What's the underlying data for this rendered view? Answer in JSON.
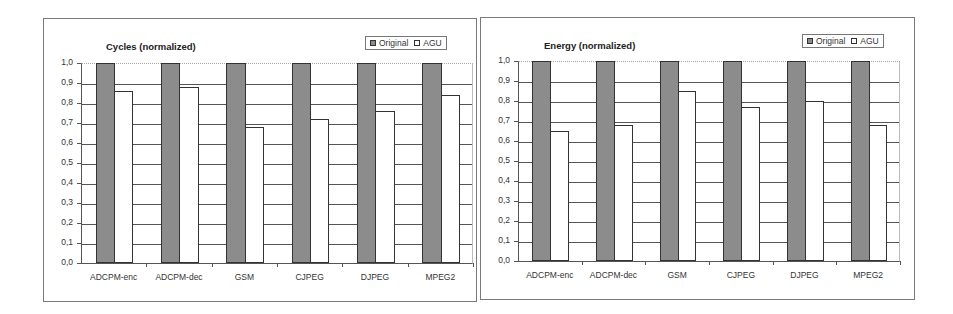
{
  "chart_data": [
    {
      "type": "bar",
      "title": "Cycles (normalized)",
      "categories": [
        "ADCPM-enc",
        "ADCPM-dec",
        "GSM",
        "CJPEG",
        "DJPEG",
        "MPEG2"
      ],
      "series": [
        {
          "name": "Original",
          "color": "#8c8c8c",
          "values": [
            1.0,
            1.0,
            1.0,
            1.0,
            1.0,
            1.0
          ]
        },
        {
          "name": "AGU",
          "color": "#ffffff",
          "values": [
            0.86,
            0.88,
            0.68,
            0.72,
            0.76,
            0.84
          ]
        }
      ],
      "yticks": [
        "0,0",
        "0,1",
        "0,2",
        "0,3",
        "0,4",
        "0,5",
        "0,6",
        "0,7",
        "0,8",
        "0,9",
        "1,0"
      ],
      "ylim": [
        0,
        1.0
      ],
      "xlabel": "",
      "ylabel": "",
      "grid": true,
      "legend_position": "top-right"
    },
    {
      "type": "bar",
      "title": "Energy (normalized)",
      "categories": [
        "ADCPM-enc",
        "ADCPM-dec",
        "GSM",
        "CJPEG",
        "DJPEG",
        "MPEG2"
      ],
      "series": [
        {
          "name": "Original",
          "color": "#8c8c8c",
          "values": [
            1.0,
            1.0,
            1.0,
            1.0,
            1.0,
            1.0
          ]
        },
        {
          "name": "AGU",
          "color": "#ffffff",
          "values": [
            0.65,
            0.68,
            0.85,
            0.77,
            0.8,
            0.68
          ]
        }
      ],
      "yticks": [
        "0,0",
        "0,1",
        "0,2",
        "0,3",
        "0,4",
        "0,5",
        "0,6",
        "0,7",
        "0,8",
        "0,9",
        "1,0"
      ],
      "ylim": [
        0,
        1.0
      ],
      "xlabel": "",
      "ylabel": "",
      "grid": true,
      "legend_position": "top-right"
    }
  ],
  "legend": {
    "original": "Original",
    "agu": "AGU"
  }
}
